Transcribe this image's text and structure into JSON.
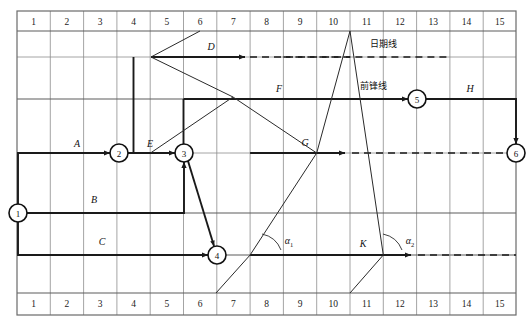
{
  "diagram": {
    "grid": {
      "x_start": 17,
      "x_end": 516,
      "col_count": 15,
      "top_axis_labels": [
        "1",
        "2",
        "3",
        "4",
        "5",
        "6",
        "7",
        "8",
        "9",
        "10",
        "11",
        "12",
        "13",
        "14",
        "15"
      ],
      "bottom_axis_labels": [
        "1",
        "2",
        "3",
        "4",
        "5",
        "6",
        "7",
        "8",
        "9",
        "10",
        "11",
        "12",
        "13",
        "14",
        "15"
      ],
      "row_lines_y": [
        11,
        31,
        57,
        99,
        153,
        213,
        255,
        293,
        315
      ],
      "frame_top": 11,
      "frame_bottom": 315,
      "header_band_bottom": 31,
      "footer_band_top": 293
    },
    "nodes": [
      {
        "id": "1",
        "label": "1",
        "cx": 18,
        "cy": 213,
        "r": 9
      },
      {
        "id": "2",
        "label": "2",
        "cx": 119,
        "cy": 153,
        "r": 9
      },
      {
        "id": "3",
        "label": "3",
        "cx": 184,
        "cy": 153,
        "r": 9
      },
      {
        "id": "4",
        "label": "4",
        "cx": 217,
        "cy": 255,
        "r": 9
      },
      {
        "id": "5",
        "label": "5",
        "cx": 417,
        "cy": 99,
        "r": 9
      },
      {
        "id": "6",
        "label": "6",
        "cx": 516,
        "cy": 153,
        "r": 9
      }
    ],
    "activities": [
      {
        "name": "A",
        "label": "A",
        "x": 77,
        "y": 147
      },
      {
        "name": "B",
        "label": "B",
        "x": 94,
        "y": 203
      },
      {
        "name": "C",
        "label": "C",
        "x": 102,
        "y": 245
      },
      {
        "name": "D",
        "label": "D",
        "x": 211,
        "y": 49
      },
      {
        "name": "E",
        "label": "E",
        "x": 150,
        "y": 147
      },
      {
        "name": "F",
        "label": "F",
        "x": 279,
        "y": 92
      },
      {
        "name": "G",
        "label": "G",
        "x": 305,
        "y": 146
      },
      {
        "name": "H",
        "label": "H",
        "x": 470,
        "y": 92
      },
      {
        "name": "K",
        "label": "K",
        "x": 363,
        "y": 246
      }
    ],
    "annotations": [
      {
        "name": "date-line-label",
        "label": "日期线",
        "x": 383,
        "y": 46
      },
      {
        "name": "front-line-label",
        "label": "前锋线",
        "x": 373,
        "y": 88
      }
    ],
    "angles": [
      {
        "name": "alpha-1",
        "base": "α",
        "sub": "1",
        "x": 289,
        "y": 243
      },
      {
        "name": "alpha-2",
        "base": "α",
        "sub": "2",
        "x": 410,
        "y": 243
      }
    ]
  }
}
